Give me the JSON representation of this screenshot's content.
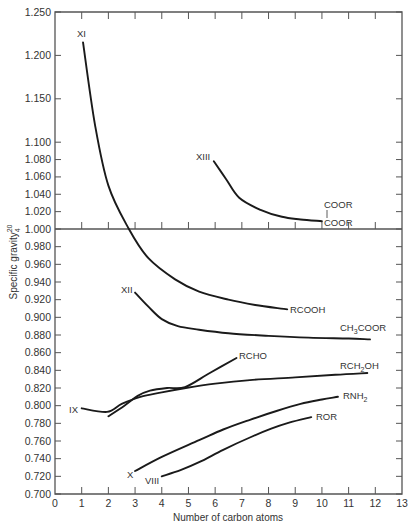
{
  "chart_data": {
    "type": "line",
    "title": "",
    "xlabel": "Number of carbon atoms",
    "ylabel": "Specific gravity",
    "ylabel_superscript": "20",
    "ylabel_subscript": "4",
    "xlim": [
      0,
      13
    ],
    "ylim": [
      0.7,
      1.25
    ],
    "x_ticks": [
      0,
      1,
      2,
      3,
      4,
      5,
      6,
      7,
      8,
      9,
      10,
      11,
      12,
      13
    ],
    "x_tick_labels": [
      "0",
      "1",
      "2",
      "3",
      "4",
      "5",
      "6",
      "7",
      "8",
      "9",
      "10",
      "11",
      "12",
      "13"
    ],
    "y_ticks": [
      1.25,
      1.2,
      1.15,
      1.1,
      1.08,
      1.06,
      1.04,
      1.02,
      1.0,
      0.98,
      0.96,
      0.94,
      0.92,
      0.9,
      0.88,
      0.86,
      0.84,
      0.82,
      0.8,
      0.78,
      0.76,
      0.74,
      0.72,
      0.7
    ],
    "y_tick_labels": [
      "1.250",
      "1.200",
      "1.150",
      "1.100",
      "1.080",
      "1.060",
      "1.040",
      "1.020",
      "1.000",
      "0.980",
      "0.960",
      "0.940",
      "0.920",
      "0.900",
      "0.880",
      "0.860",
      "0.840",
      "0.820",
      "0.800",
      "0.780",
      "0.760",
      "0.740",
      "0.720",
      "0.700"
    ],
    "grid": false,
    "legend": "none (curves labeled directly)",
    "reference_line": {
      "y": 1.0,
      "style": "horizontal axis line across plot"
    },
    "series": [
      {
        "name": "RCOOH",
        "start_label": "XI",
        "x": [
          1.05,
          1.5,
          2.0,
          2.77,
          3.5,
          4.5,
          5.4,
          6.5,
          7.5,
          8.7
        ],
        "y": [
          1.215,
          1.12,
          1.05,
          1.0,
          0.967,
          0.943,
          0.929,
          0.92,
          0.914,
          0.909
        ]
      },
      {
        "name": "CH3COOR",
        "display_name": "CH₃COOR",
        "start_label": "XII",
        "x": [
          3.0,
          3.5,
          4.0,
          4.6,
          5.4,
          6.5,
          8.0,
          9.5,
          11.0,
          11.8
        ],
        "y": [
          0.928,
          0.912,
          0.898,
          0.89,
          0.886,
          0.882,
          0.879,
          0.877,
          0.876,
          0.875
        ]
      },
      {
        "name": "COOR-COOR",
        "display_name": "COOR|COOR",
        "start_label": "XIII",
        "x": [
          5.95,
          6.4,
          6.9,
          7.7,
          8.5,
          9.2,
          10.0
        ],
        "y": [
          1.078,
          1.058,
          1.036,
          1.022,
          1.014,
          1.011,
          1.009
        ]
      },
      {
        "name": "RCHO",
        "x": [
          2.0,
          2.6,
          3.1,
          3.56,
          4.2,
          4.87,
          5.8,
          6.8
        ],
        "y": [
          0.788,
          0.8,
          0.811,
          0.817,
          0.82,
          0.821,
          0.837,
          0.854
        ]
      },
      {
        "name": "RCH2OH",
        "display_name": "RCH₂OH",
        "start_label": "IX",
        "x": [
          1.0,
          1.95,
          2.5,
          3.2,
          4.0,
          4.9,
          6.0,
          7.3,
          9.0,
          10.5,
          11.7
        ],
        "y": [
          0.797,
          0.793,
          0.802,
          0.81,
          0.815,
          0.82,
          0.825,
          0.829,
          0.832,
          0.835,
          0.837
        ]
      },
      {
        "name": "RNH2",
        "display_name": "RNH₂",
        "start_label": "X",
        "x": [
          3.0,
          4.0,
          5.4,
          6.3,
          7.3,
          8.3,
          9.2,
          10.0,
          10.6
        ],
        "y": [
          0.726,
          0.742,
          0.761,
          0.773,
          0.784,
          0.794,
          0.802,
          0.807,
          0.81
        ]
      },
      {
        "name": "ROR",
        "start_label": "VIII",
        "x": [
          4.0,
          4.7,
          5.4,
          6.3,
          7.3,
          8.1,
          8.8,
          9.6
        ],
        "y": [
          0.72,
          0.727,
          0.736,
          0.75,
          0.764,
          0.774,
          0.781,
          0.787
        ]
      }
    ]
  }
}
